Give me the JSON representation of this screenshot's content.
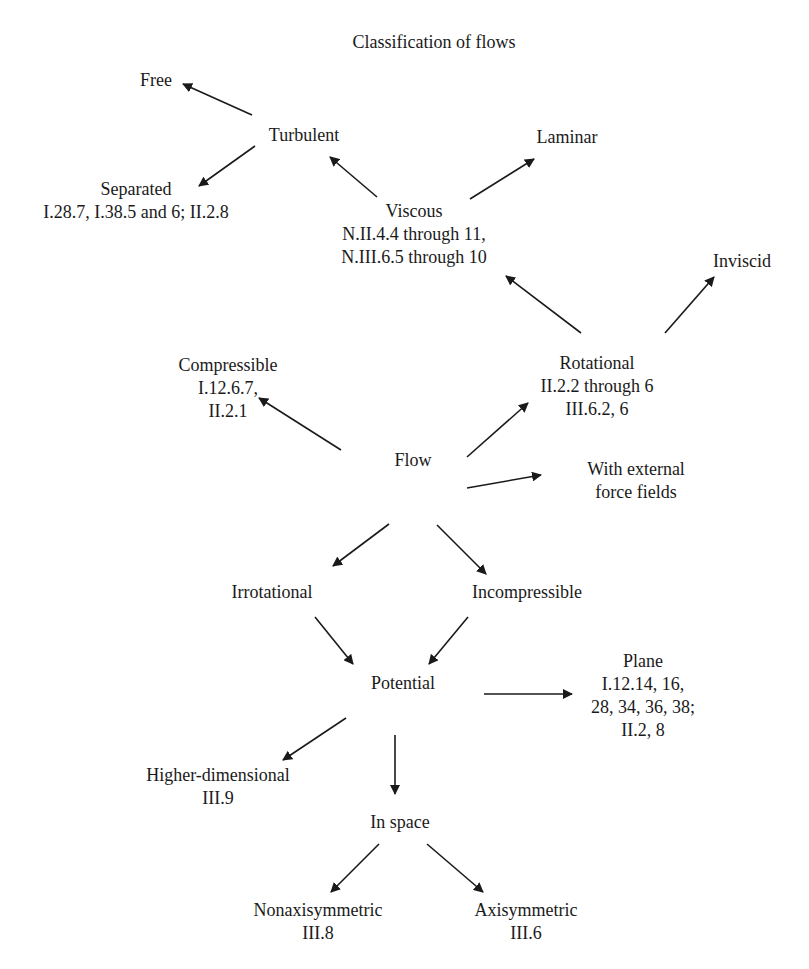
{
  "title": "Classification of flows",
  "colors": {
    "ink": "#1a1a1a",
    "background": "#ffffff"
  },
  "nodes": {
    "free": {
      "label": "Free"
    },
    "turbulent": {
      "label": "Turbulent"
    },
    "laminar": {
      "label": "Laminar"
    },
    "separated": {
      "label": "Separated",
      "refs": [
        "I.28.7, I.38.5 and 6; II.2.8"
      ]
    },
    "viscous": {
      "label": "Viscous",
      "refs": [
        "N.II.4.4 through 11,",
        "N.III.6.5 through 10"
      ]
    },
    "inviscid": {
      "label": "Inviscid"
    },
    "compressible": {
      "label": "Compressible",
      "refs": [
        "I.12.6.7,",
        "II.2.1"
      ]
    },
    "rotational": {
      "label": "Rotational",
      "refs": [
        "II.2.2 through 6",
        "III.6.2, 6"
      ]
    },
    "flow": {
      "label": "Flow"
    },
    "external_force": {
      "label": "With external",
      "refs": [
        "force fields"
      ]
    },
    "irrotational": {
      "label": "Irrotational"
    },
    "incompressible": {
      "label": "Incompressible"
    },
    "potential": {
      "label": "Potential"
    },
    "plane": {
      "label": "Plane",
      "refs": [
        "I.12.14, 16,",
        "28, 34, 36, 38;",
        "II.2, 8"
      ]
    },
    "higher_dimensional": {
      "label": "Higher-dimensional",
      "refs": [
        "III.9"
      ]
    },
    "in_space": {
      "label": "In space"
    },
    "nonaxisymmetric": {
      "label": "Nonaxisymmetric",
      "refs": [
        "III.8"
      ]
    },
    "axisymmetric": {
      "label": "Axisymmetric",
      "refs": [
        "III.6"
      ]
    }
  },
  "edges": [
    {
      "from": "turbulent",
      "to": "free"
    },
    {
      "from": "turbulent",
      "to": "separated"
    },
    {
      "from": "viscous",
      "to": "turbulent"
    },
    {
      "from": "viscous",
      "to": "laminar"
    },
    {
      "from": "rotational",
      "to": "viscous"
    },
    {
      "from": "rotational",
      "to": "inviscid"
    },
    {
      "from": "flow",
      "to": "compressible"
    },
    {
      "from": "flow",
      "to": "rotational"
    },
    {
      "from": "flow",
      "to": "external_force"
    },
    {
      "from": "flow",
      "to": "irrotational"
    },
    {
      "from": "flow",
      "to": "incompressible"
    },
    {
      "from": "irrotational",
      "to": "potential"
    },
    {
      "from": "incompressible",
      "to": "potential"
    },
    {
      "from": "potential",
      "to": "plane"
    },
    {
      "from": "potential",
      "to": "higher_dimensional"
    },
    {
      "from": "potential",
      "to": "in_space"
    },
    {
      "from": "in_space",
      "to": "nonaxisymmetric"
    },
    {
      "from": "in_space",
      "to": "axisymmetric"
    }
  ]
}
